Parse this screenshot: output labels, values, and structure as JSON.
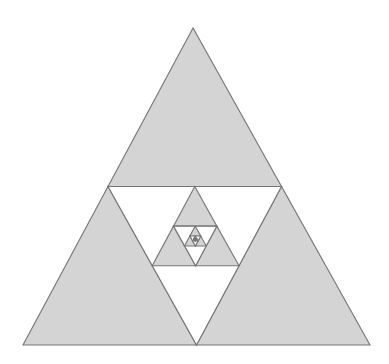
{
  "figure": {
    "type": "geometric-fractal-diagram",
    "width": 389,
    "height": 364,
    "background_color": "#ffffff"
  },
  "style": {
    "fill_color": "#d4d4d4",
    "stroke_color": "#767676",
    "stroke_width": 1.1,
    "hole_color": "#ffffff"
  },
  "chart_data": {
    "type": "diagram",
    "shape": "sierpinski-triangle",
    "orientation": "apex-up",
    "outer_triangle": {
      "apex": [
        193,
        28
      ],
      "bottom_left": [
        23,
        345
      ],
      "bottom_right": [
        370,
        345
      ],
      "base_width": 347,
      "height": 317
    },
    "construction_rule": "Each upright triangle is divided into four congruent sub-triangles; the three corner sub-triangles are filled solid gray, and the central inverted sub-triangle is left white. A new upright Sierpinski triangle of half scale is inscribed in the central white region with its apex at the midpoint of the parent's midline.",
    "recursion_depth": 4,
    "nested_triangles": [
      {
        "level": 0,
        "apex": [
          193,
          28
        ],
        "bottom_left": [
          23,
          345
        ],
        "bottom_right": [
          370,
          345
        ],
        "filled_corners": 3,
        "central_hole": true
      },
      {
        "level": 1,
        "apex": [
          193.5,
          186.5
        ],
        "bottom_left": [
          150.75,
          265.75
        ],
        "bottom_right": [
          236.25,
          265.75
        ],
        "filled_corners": 3,
        "central_hole": true
      },
      {
        "level": 2,
        "apex": [
          193.5,
          226.1
        ],
        "bottom_left": [
          172.1,
          245.7
        ],
        "bottom_right": [
          214.9,
          245.7
        ],
        "filled_corners": 3,
        "central_hole": true
      },
      {
        "level": 3,
        "apex": [
          193.5,
          235.9
        ],
        "bottom_left": [
          182.8,
          245.7
        ],
        "bottom_right": [
          204.2,
          245.7
        ],
        "filled_corners": 3,
        "central_hole": true
      }
    ],
    "midline": {
      "y": 186.5,
      "left_point": [
        108,
        186.5
      ],
      "right_point": [
        281.5,
        186.5
      ]
    },
    "counts": {
      "solid_gray_triangles": 12,
      "white_holes": 4,
      "levels": 4
    },
    "labels": [],
    "annotations": [],
    "legend": null,
    "grid": false,
    "axes": false
  }
}
